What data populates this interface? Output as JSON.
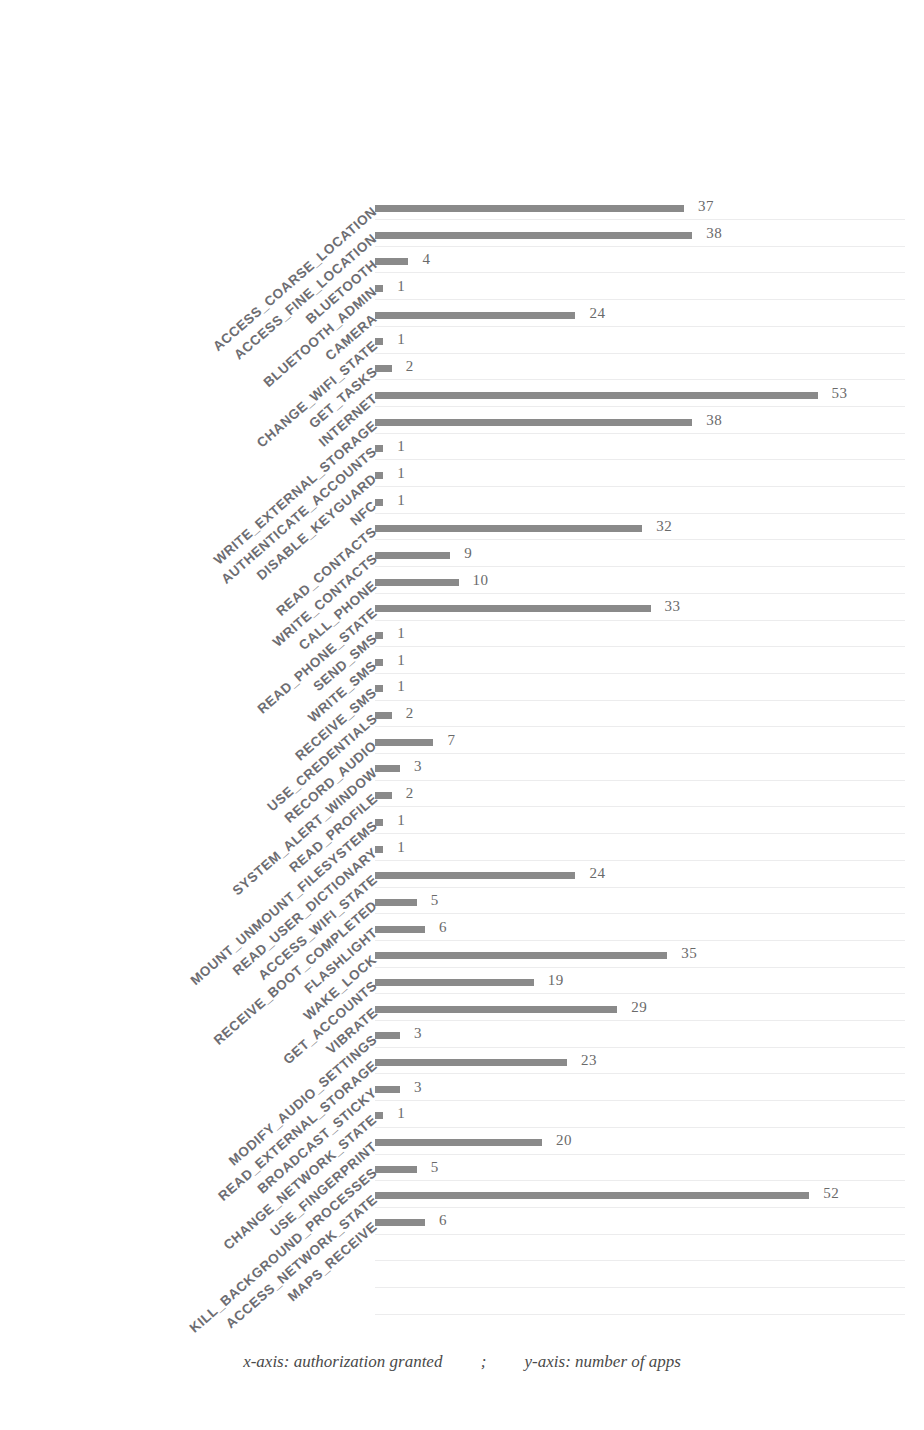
{
  "figure": {
    "caption_x": "x-axis: authorization granted",
    "caption_separator": ";",
    "caption_y": "y-axis: number of apps",
    "bar_color": "#8a8a8a",
    "label_color": "#6d6d72",
    "value_color": "#6a6a6a",
    "background": "#ffffff"
  },
  "chart_data": {
    "type": "bar",
    "orientation": "horizontal",
    "title": "",
    "xlabel": "authorization granted",
    "ylabel": "number of apps",
    "xlim": [
      0,
      53
    ],
    "grid": false,
    "legend": "none",
    "categories": [
      "ACCESS_COARSE_LOCATION",
      "ACCESS_FINE_LOCATION",
      "BLUETOOTH",
      "BLUETOOTH_ADMIN",
      "CAMERA",
      "CHANGE_WIFI_STATE",
      "GET_TASKS",
      "INTERNET",
      "WRITE_EXTERNAL_STORAGE",
      "AUTHENTICATE_ACCOUNTS",
      "DISABLE_KEYGUARD",
      "NFC",
      "READ_CONTACTS",
      "WRITE_CONTACTS",
      "CALL_PHONE",
      "READ_PHONE_STATE",
      "SEND_SMS",
      "WRITE_SMS",
      "RECEIVE_SMS",
      "USE_CREDENTIALS",
      "RECORD_AUDIO",
      "SYSTEM_ALERT_WINDOW",
      "READ_PROFILE",
      "MOUNT_UNMOUNT_FILESYSTEMS",
      "READ_USER_DICTIONARY",
      "ACCESS_WIFI_STATE",
      "RECEIVE_BOOT_COMPLETED",
      "FLASHLIGHT",
      "WAKE_LOCK",
      "GET_ACCOUNTS",
      "VIBRATE",
      "MODIFY_AUDIO_SETTINGS",
      "READ_EXTERNAL_STORAGE",
      "BROADCAST_STICKY",
      "CHANGE_NETWORK_STATE",
      "USE_FINGERPRINT",
      "KILL_BACKGROUND_PROCESSES",
      "ACCESS_NETWORK_STATE",
      "MAPS_RECEIVE"
    ],
    "values": [
      37,
      38,
      4,
      1,
      24,
      1,
      2,
      53,
      38,
      1,
      1,
      1,
      32,
      9,
      10,
      33,
      1,
      1,
      1,
      2,
      7,
      3,
      2,
      1,
      1,
      24,
      5,
      6,
      35,
      19,
      29,
      3,
      23,
      3,
      1,
      20,
      5,
      52,
      6
    ]
  }
}
